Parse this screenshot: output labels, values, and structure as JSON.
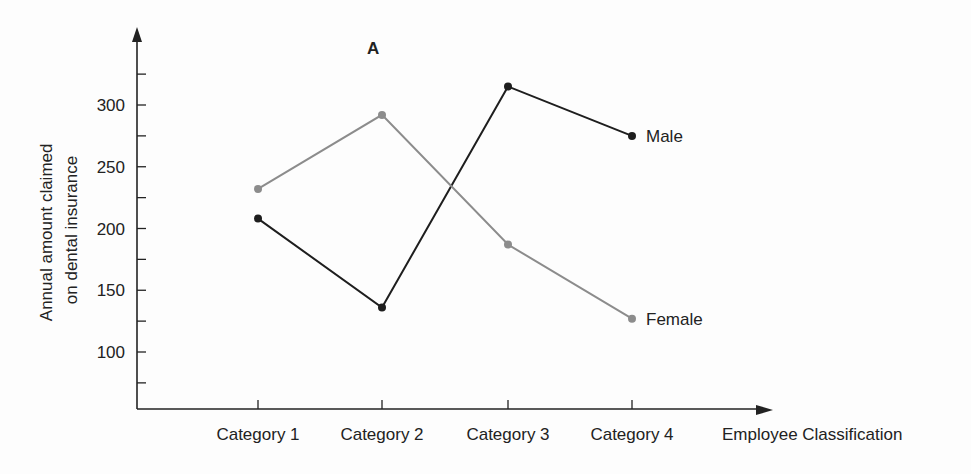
{
  "chart_data": {
    "type": "line",
    "title": "A",
    "xlabel": "Employee Classification",
    "ylabel": "Annual amount claimed on dental insurance",
    "ylabel_lines": [
      "Annual amount claimed",
      "on dental insurance"
    ],
    "categories": [
      "Category 1",
      "Category 2",
      "Category 3",
      "Category 4"
    ],
    "series": [
      {
        "name": "Male",
        "color": "#1e1e1e",
        "values": [
          208,
          136,
          315,
          275
        ]
      },
      {
        "name": "Female",
        "color": "#8c8c8c",
        "values": [
          232,
          292,
          187,
          127
        ]
      }
    ],
    "yticks": [
      100,
      150,
      200,
      250,
      300
    ],
    "ylim": [
      50,
      350
    ],
    "grid": false,
    "legend_position": "inline-end-of-line"
  }
}
